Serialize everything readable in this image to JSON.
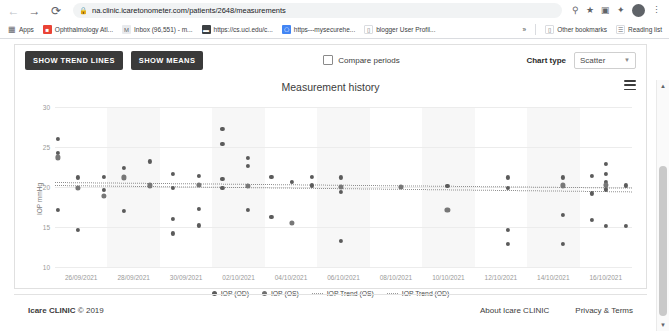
{
  "browser": {
    "back_icon": "back-arrow-icon",
    "forward_icon": "forward-arrow-icon",
    "reload_icon": "reload-icon",
    "lock_icon": "lock-icon",
    "url": "na.clinic.icaretonometer.com/patients/2648/measurements",
    "url_host": "na.clinic.icaretonometer.com",
    "url_path": "/patients/2648/measurements",
    "toolbar_icons": [
      "key-icon",
      "star-icon",
      "extension-icon",
      "profile-share-icon"
    ],
    "avatar_initial": "G",
    "menu_icon": "kebab-menu-icon",
    "bookmarks": [
      {
        "label": "Apps",
        "icon": "apps-grid-icon"
      },
      {
        "label": "Ophthalmology Atl...",
        "icon": "bookmark-favicon"
      },
      {
        "label": "Inbox (96,551) - m...",
        "icon": "gmail-icon"
      },
      {
        "label": "https://cs.uci.edu/c...",
        "icon": "bookmark-favicon"
      },
      {
        "label": "https---mysecurehe...",
        "icon": "bookmark-favicon"
      },
      {
        "label": "blogger User Profil...",
        "icon": "bookmark-favicon"
      }
    ],
    "overflow_label": "»",
    "other_bookmarks": "Other bookmarks",
    "reading_list": "Reading list"
  },
  "toolbar": {
    "show_trend_lines": "SHOW TREND LINES",
    "show_means": "SHOW MEANS",
    "compare_periods": "Compare periods",
    "compare_checked": false,
    "chart_type_label": "Chart type",
    "chart_type_value": "Scatter",
    "chart_type_options": [
      "Scatter",
      "Line",
      "Bar"
    ],
    "menu_icon": "hamburger-menu-icon"
  },
  "chart_data": {
    "type": "scatter",
    "title": "Measurement history",
    "xlabel": "",
    "ylabel": "IOP mmHg",
    "ylim": [
      10,
      30
    ],
    "yticks": [
      30,
      25,
      20,
      15,
      10
    ],
    "xticks": [
      "26/09/2021",
      "28/09/2021",
      "30/09/2021",
      "02/10/2021",
      "04/10/2021",
      "06/10/2021",
      "08/10/2021",
      "10/10/2021",
      "12/10/2021",
      "14/10/2021",
      "16/10/2021"
    ],
    "xlim": [
      "25/09/2021",
      "17/10/2021"
    ],
    "grid": true,
    "legend_position": "bottom",
    "legend": [
      {
        "name": "IOP (OD)",
        "marker": "dot",
        "color": "#5b5b5b"
      },
      {
        "name": "IOP (OS)",
        "marker": "dot",
        "color": "#6f6f6f"
      },
      {
        "name": "IOP Trend (OS)",
        "marker": "dotted-line",
        "color": "#9a9a9a"
      },
      {
        "name": "IOP Trend (OD)",
        "marker": "dotted-line",
        "color": "#9a9a9a"
      }
    ],
    "series": [
      {
        "name": "IOP (OD)",
        "color": "#5b5b5b",
        "points": [
          {
            "x": 0.5,
            "y": 26.0
          },
          {
            "x": 0.5,
            "y": 24.3
          },
          {
            "x": 0.5,
            "y": 17.1
          },
          {
            "x": 4.0,
            "y": 21.2
          },
          {
            "x": 4.0,
            "y": 14.6
          },
          {
            "x": 8.5,
            "y": 21.3
          },
          {
            "x": 8.5,
            "y": 19.6
          },
          {
            "x": 12.0,
            "y": 22.4
          },
          {
            "x": 12.0,
            "y": 17.0
          },
          {
            "x": 16.5,
            "y": 23.2
          },
          {
            "x": 20.5,
            "y": 21.6
          },
          {
            "x": 20.5,
            "y": 19.9
          },
          {
            "x": 20.5,
            "y": 16.0
          },
          {
            "x": 20.5,
            "y": 14.2
          },
          {
            "x": 25.0,
            "y": 21.4
          },
          {
            "x": 25.0,
            "y": 17.3
          },
          {
            "x": 25.0,
            "y": 15.2
          },
          {
            "x": 29.0,
            "y": 27.3
          },
          {
            "x": 29.0,
            "y": 25.4
          },
          {
            "x": 29.0,
            "y": 21.0
          },
          {
            "x": 29.0,
            "y": 19.9
          },
          {
            "x": 33.5,
            "y": 23.6
          },
          {
            "x": 33.5,
            "y": 22.6
          },
          {
            "x": 33.5,
            "y": 17.1
          },
          {
            "x": 37.5,
            "y": 21.3
          },
          {
            "x": 37.5,
            "y": 16.3
          },
          {
            "x": 41.0,
            "y": 20.6
          },
          {
            "x": 44.5,
            "y": 21.3
          },
          {
            "x": 44.5,
            "y": 20.2
          },
          {
            "x": 49.5,
            "y": 21.2
          },
          {
            "x": 49.5,
            "y": 19.4
          },
          {
            "x": 49.5,
            "y": 13.3
          },
          {
            "x": 68.0,
            "y": 20.1
          },
          {
            "x": 78.5,
            "y": 21.2
          },
          {
            "x": 78.5,
            "y": 19.9
          },
          {
            "x": 78.5,
            "y": 14.6
          },
          {
            "x": 78.5,
            "y": 12.9
          },
          {
            "x": 88.0,
            "y": 21.2
          },
          {
            "x": 88.0,
            "y": 16.5
          },
          {
            "x": 88.0,
            "y": 12.9
          },
          {
            "x": 93.0,
            "y": 21.4
          },
          {
            "x": 93.0,
            "y": 19.2
          },
          {
            "x": 93.0,
            "y": 15.9
          },
          {
            "x": 95.5,
            "y": 22.9
          },
          {
            "x": 95.5,
            "y": 21.6
          },
          {
            "x": 95.5,
            "y": 20.6
          },
          {
            "x": 95.5,
            "y": 19.7
          },
          {
            "x": 95.5,
            "y": 15.1
          },
          {
            "x": 99.0,
            "y": 20.2
          },
          {
            "x": 99.0,
            "y": 15.1
          }
        ]
      },
      {
        "name": "IOP (OS)",
        "color": "#777777",
        "points": [
          {
            "x": 0.5,
            "y": 23.7
          },
          {
            "x": 4.0,
            "y": 19.9
          },
          {
            "x": 8.5,
            "y": 18.9
          },
          {
            "x": 12.0,
            "y": 21.2
          },
          {
            "x": 16.5,
            "y": 20.2
          },
          {
            "x": 25.0,
            "y": 20.3
          },
          {
            "x": 33.5,
            "y": 20.1
          },
          {
            "x": 41.0,
            "y": 15.5
          },
          {
            "x": 49.5,
            "y": 20.0
          },
          {
            "x": 60.0,
            "y": 20.0
          },
          {
            "x": 68.0,
            "y": 17.1
          },
          {
            "x": 88.0,
            "y": 20.2
          },
          {
            "x": 95.5,
            "y": 20.3
          }
        ]
      }
    ],
    "trend_lines": [
      {
        "name": "IOP Trend (OD)",
        "y_start": 20.6,
        "y_end": 19.9,
        "style": "dotted"
      },
      {
        "name": "IOP Trend (OS)",
        "y_start": 20.3,
        "y_end": 19.5,
        "style": "dotted"
      }
    ]
  },
  "footer": {
    "copyright": "Icare CLINIC",
    "copyright_year": "© 2019",
    "about_link": "About Icare CLINIC",
    "privacy_link": "Privacy & Terms"
  },
  "scrollbar": {
    "up_icon": "scroll-up-arrow",
    "down_icon": "scroll-down-arrow"
  }
}
